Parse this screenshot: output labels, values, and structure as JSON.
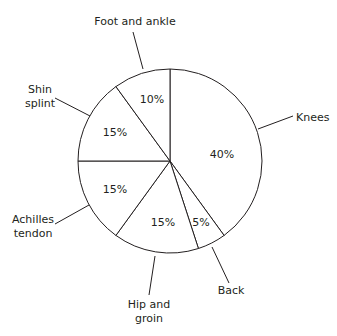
{
  "chart_data": {
    "type": "pie",
    "title": "",
    "slices": [
      {
        "label": "Knees",
        "value": 40,
        "display": "40%"
      },
      {
        "label": "Back",
        "value": 5,
        "display": "5%"
      },
      {
        "label": "Hip and groin",
        "value": 15,
        "display": "15%"
      },
      {
        "label": "Achilles tendon",
        "value": 15,
        "display": "15%"
      },
      {
        "label": "Shin splint",
        "value": 15,
        "display": "15%"
      },
      {
        "label": "Foot and ankle",
        "value": 10,
        "display": "10%"
      }
    ],
    "start_angle_deg": 0,
    "direction": "clockwise",
    "colors": {
      "fill": "#ffffff",
      "stroke": "#231f20"
    }
  },
  "labels": {
    "knees": "Knees",
    "back": "Back",
    "hip_line1": "Hip and",
    "hip_line2": "groin",
    "achilles_line1": "Achilles",
    "achilles_line2": "tendon",
    "shin_line1": "Shin",
    "shin_line2": "splint",
    "foot": "Foot and ankle"
  },
  "pcts": {
    "knees": "40%",
    "back": "5%",
    "hip": "15%",
    "achilles": "15%",
    "shin": "15%",
    "foot": "10%"
  }
}
